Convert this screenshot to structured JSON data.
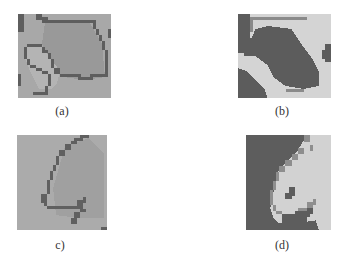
{
  "figure": {
    "panels": [
      {
        "id": "a",
        "caption": "(a)",
        "description": "segmented region with dark contour outline"
      },
      {
        "id": "b",
        "caption": "(b)",
        "description": "binary-like segmentation, dark region on light background"
      },
      {
        "id": "c",
        "caption": "c)",
        "description": "single dark contour edge on gray texture"
      },
      {
        "id": "d",
        "caption": "(d)",
        "description": "dark region with light crescent area"
      }
    ],
    "colors": {
      "background": "#ffffff",
      "panel_gray": "#a9a9a9",
      "mid_gray": "#8f8f8f",
      "dark": "#5a5a5a",
      "light": "#d6d6d6",
      "caption_text": "#333333"
    }
  }
}
